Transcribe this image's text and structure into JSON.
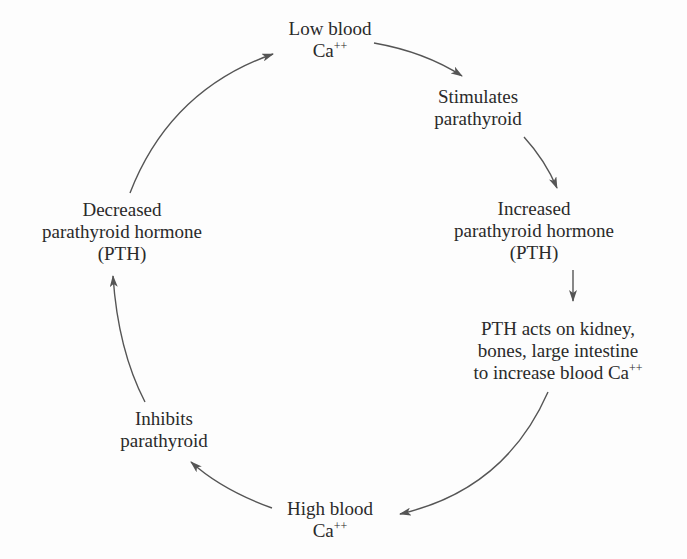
{
  "diagram": {
    "type": "cycle",
    "colors": {
      "text": "#2a2a2a",
      "arrow": "#555555",
      "background": "#fdfdfd"
    },
    "nodes": [
      {
        "id": "low-blood-ca",
        "lines": [
          "Low blood",
          "Ca"
        ],
        "superscript": "++"
      },
      {
        "id": "stimulates-parathyroid",
        "lines": [
          "Stimulates",
          "parathyroid"
        ]
      },
      {
        "id": "increased-pth",
        "lines": [
          "Increased",
          "parathyroid hormone",
          "(PTH)"
        ]
      },
      {
        "id": "pth-acts",
        "lines": [
          "PTH acts on kidney,",
          "bones, large intestine",
          "to increase blood Ca"
        ],
        "superscript": "++"
      },
      {
        "id": "high-blood-ca",
        "lines": [
          "High blood",
          "Ca"
        ],
        "superscript": "++"
      },
      {
        "id": "inhibits-parathyroid",
        "lines": [
          "Inhibits",
          "parathyroid"
        ]
      },
      {
        "id": "decreased-pth",
        "lines": [
          "Decreased",
          "parathyroid hormone",
          "(PTH)"
        ]
      }
    ],
    "edges": [
      {
        "from": "low-blood-ca",
        "to": "stimulates-parathyroid"
      },
      {
        "from": "stimulates-parathyroid",
        "to": "increased-pth"
      },
      {
        "from": "increased-pth",
        "to": "pth-acts"
      },
      {
        "from": "pth-acts",
        "to": "high-blood-ca"
      },
      {
        "from": "high-blood-ca",
        "to": "inhibits-parathyroid"
      },
      {
        "from": "inhibits-parathyroid",
        "to": "decreased-pth"
      },
      {
        "from": "decreased-pth",
        "to": "low-blood-ca"
      }
    ]
  }
}
